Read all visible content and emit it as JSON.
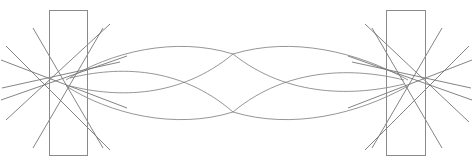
{
  "figure": {
    "kind": "optical-ray-trace-diagram",
    "title": "",
    "width": 473,
    "height": 161,
    "background_color": "#ffffff",
    "ray_color": "#6e6e6e",
    "aperture_color": "#8a8a8a",
    "stroke_width": 0.85
  },
  "chart_data": {
    "type": "line",
    "title": "",
    "xlabel": "",
    "ylabel": "",
    "grid": false,
    "legend": "none",
    "xlim": [
      0,
      473
    ],
    "ylim": [
      0,
      161
    ],
    "axis_orientation": "screen-pixels-y-down",
    "elements": {
      "apertures": [
        {
          "name": "left-aperture",
          "x": 49,
          "y": 10,
          "width": 38,
          "height": 145
        },
        {
          "name": "right-aperture",
          "x": 386,
          "y": 10,
          "width": 39,
          "height": 145
        }
      ],
      "crossover_points": [
        {
          "name": "left-waist",
          "x": 68,
          "y": 82
        },
        {
          "name": "center-upper-cross",
          "x": 233,
          "y": 54
        },
        {
          "name": "center-lower-cross",
          "x": 233,
          "y": 112
        },
        {
          "name": "right-waist",
          "x": 406,
          "y": 82
        }
      ]
    },
    "series": [
      {
        "name": "left-fan-steep-down",
        "kind": "straight-ray",
        "points": [
          [
            33,
            28
          ],
          [
            103,
            148
          ]
        ]
      },
      {
        "name": "left-fan-steep-up",
        "kind": "straight-ray",
        "points": [
          [
            33,
            148
          ],
          [
            103,
            28
          ]
        ]
      },
      {
        "name": "left-fan-medium-down",
        "kind": "straight-ray",
        "points": [
          [
            6,
            46
          ],
          [
            110,
            150
          ]
        ]
      },
      {
        "name": "left-fan-medium-up",
        "kind": "straight-ray",
        "points": [
          [
            6,
            120
          ],
          [
            110,
            24
          ]
        ]
      },
      {
        "name": "left-fan-shallow-down",
        "kind": "straight-ray",
        "points": [
          [
            1,
            60
          ],
          [
            127,
            108
          ]
        ]
      },
      {
        "name": "left-fan-shallow-up",
        "kind": "straight-ray",
        "points": [
          [
            1,
            100
          ],
          [
            127,
            56
          ]
        ]
      },
      {
        "name": "left-fan-flat-down",
        "kind": "straight-ray",
        "points": [
          [
            2,
            88
          ],
          [
            120,
            62
          ]
        ]
      },
      {
        "name": "right-fan-steep-down",
        "kind": "straight-ray",
        "points": [
          [
            372,
            28
          ],
          [
            442,
            148
          ]
        ]
      },
      {
        "name": "right-fan-steep-up",
        "kind": "straight-ray",
        "points": [
          [
            372,
            148
          ],
          [
            442,
            28
          ]
        ]
      },
      {
        "name": "right-fan-medium-down",
        "kind": "straight-ray",
        "points": [
          [
            365,
            24
          ],
          [
            469,
            122
          ]
        ]
      },
      {
        "name": "right-fan-medium-up",
        "kind": "straight-ray",
        "points": [
          [
            365,
            150
          ],
          [
            469,
            46
          ]
        ]
      },
      {
        "name": "right-fan-shallow-down",
        "kind": "straight-ray",
        "points": [
          [
            348,
            56
          ],
          [
            472,
            100
          ]
        ]
      },
      {
        "name": "right-fan-shallow-up",
        "kind": "straight-ray",
        "points": [
          [
            348,
            108
          ],
          [
            472,
            60
          ]
        ]
      },
      {
        "name": "right-fan-flat-up",
        "kind": "straight-ray",
        "points": [
          [
            352,
            62
          ],
          [
            471,
            88
          ]
        ]
      },
      {
        "name": "envelope-outer-upper-left",
        "kind": "curved-ray",
        "control_summary": "outer upper lobe, left half, apex near (160,40)",
        "points": [
          [
            68,
            82
          ],
          [
            120,
            56
          ],
          [
            175,
            41
          ],
          [
            233,
            54
          ]
        ]
      },
      {
        "name": "envelope-outer-lower-left",
        "kind": "curved-ray",
        "control_summary": "outer lower lobe, left half, apex near (160,126)",
        "points": [
          [
            68,
            82
          ],
          [
            120,
            109
          ],
          [
            175,
            125
          ],
          [
            233,
            112
          ]
        ]
      },
      {
        "name": "envelope-inner-upper-left",
        "kind": "curved-ray",
        "control_summary": "inner upper lobe, left half, apex near (170,72)",
        "points": [
          [
            68,
            82
          ],
          [
            118,
            74
          ],
          [
            175,
            70
          ],
          [
            233,
            112
          ]
        ]
      },
      {
        "name": "envelope-inner-lower-left",
        "kind": "curved-ray",
        "control_summary": "inner lower lobe, left half, apex near (170,95)",
        "points": [
          [
            68,
            82
          ],
          [
            118,
            92
          ],
          [
            175,
            96
          ],
          [
            233,
            54
          ]
        ]
      },
      {
        "name": "envelope-outer-upper-right",
        "kind": "curved-ray",
        "control_summary": "outer upper lobe, right half, apex near (305,41)",
        "points": [
          [
            233,
            54
          ],
          [
            290,
            40
          ],
          [
            350,
            58
          ],
          [
            406,
            82
          ]
        ]
      },
      {
        "name": "envelope-outer-lower-right",
        "kind": "curved-ray",
        "control_summary": "outer lower lobe, right half, apex near (305,125)",
        "points": [
          [
            233,
            112
          ],
          [
            290,
            126
          ],
          [
            350,
            108
          ],
          [
            406,
            82
          ]
        ]
      },
      {
        "name": "envelope-inner-upper-right",
        "kind": "curved-ray",
        "control_summary": "inner upper lobe, right half, apex near (300,70)",
        "points": [
          [
            233,
            54
          ],
          [
            290,
            70
          ],
          [
            352,
            76
          ],
          [
            406,
            82
          ]
        ]
      },
      {
        "name": "envelope-inner-lower-right",
        "kind": "curved-ray",
        "control_summary": "inner lower lobe, right half, apex near (300,96)",
        "points": [
          [
            233,
            112
          ],
          [
            290,
            96
          ],
          [
            352,
            89
          ],
          [
            406,
            82
          ]
        ]
      }
    ]
  }
}
